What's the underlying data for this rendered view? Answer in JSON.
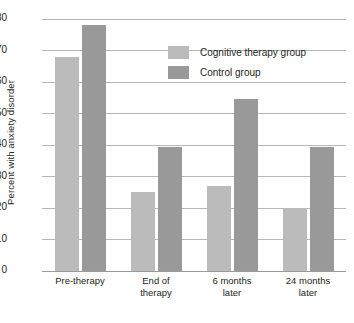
{
  "chart_data": {
    "type": "bar",
    "title": "",
    "xlabel": "",
    "ylabel": "Percent with anxiety disorder",
    "categories": [
      "Pre-therapy",
      "End of\ntherapy",
      "6 months\nlater",
      "24 months\nlater"
    ],
    "series": [
      {
        "name": "Cognitive therapy group",
        "color": "#bbbbbb",
        "values": [
          68,
          25,
          27,
          20
        ]
      },
      {
        "name": "Control group",
        "color": "#999999",
        "values": [
          78,
          39.5,
          54.5,
          39.5
        ]
      }
    ],
    "ylim": [
      0,
      80
    ],
    "yticks": [
      0,
      10,
      20,
      30,
      40,
      50,
      60,
      70,
      80
    ],
    "ytick_labels": [
      "0",
      "10",
      "20",
      "30",
      "40",
      "50",
      "60",
      "70",
      "80"
    ],
    "grid": true,
    "legend_position": "top-right"
  },
  "axis": {
    "y_title": "Percent with anxiety disorder"
  },
  "legend": {
    "entries": [
      {
        "label": "Cognitive therapy group",
        "color": "#bbbbbb"
      },
      {
        "label": "Control group",
        "color": "#999999"
      }
    ]
  },
  "x_categories": [
    {
      "line1": "Pre-therapy",
      "line2": ""
    },
    {
      "line1": "End of",
      "line2": "therapy"
    },
    {
      "line1": "6 months",
      "line2": "later"
    },
    {
      "line1": "24 months",
      "line2": "later"
    }
  ],
  "colors": {
    "background": "#ffffff",
    "gridline": "#b6b6b6",
    "baseline": "#9a9a9a",
    "text": "#231f20",
    "cognitive_therapy": "#bbbbbb",
    "control": "#999999"
  }
}
